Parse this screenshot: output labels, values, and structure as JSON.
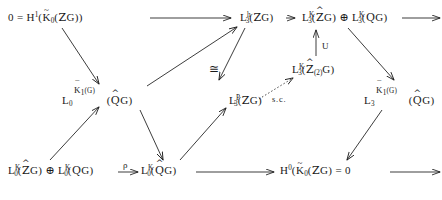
{
  "diagram": {
    "kind": "commutative-diagram",
    "width": 442,
    "height": 200,
    "ink_color": "#1a1a1a",
    "background": "#ffffff",
    "nodes": [
      {
        "id": "n1",
        "name": "node-h1-k0-zg",
        "text": "0 = H^1( K~_0 ( ZZ G))",
        "parts": {
          "zero": "0",
          "equals": "=",
          "H": "H",
          "Hsup": "1",
          "open1": "(",
          "K": "K",
          "Ksub": "0",
          "Kacc": "~",
          "open2": "(",
          "ring": "Z",
          "G": "G",
          "close": "))"
        },
        "x": 8,
        "y": 12
      },
      {
        "id": "n2",
        "name": "node-l3h-zg",
        "text": "L^h_3( ZZ G)",
        "parts": {
          "L": "L",
          "Lsup": "h",
          "Lsub": "3",
          "open": "(",
          "ring": "Z",
          "G": "G",
          "close": ")"
        },
        "x": 240,
        "y": 12
      },
      {
        "id": "n3",
        "name": "node-l3k-zhatg-sum-l3k-qg",
        "text": "L^K_3( ZZ^ G) (+) L^K_3( Q G)",
        "parts": {
          "L1": "L",
          "L1sup": "K",
          "L1sub": "3",
          "open1": "(",
          "ring1": "Z",
          "ring1acc": "^",
          "G1": "G",
          "close1": ")",
          "oplus": "⊕",
          "L2": "L",
          "L2sup": "K",
          "L2sub": "3",
          "open2": "(",
          "ring2": "Q",
          "G2": "G",
          "close2": ")"
        },
        "x": 302,
        "y": 12
      },
      {
        "id": "n4",
        "name": "node-l0-k1bar-qhatg",
        "text": "L^{K~_1(G)}_0( Q^ G)",
        "parts": {
          "L": "L",
          "Lsub": "0",
          "supK": "K",
          "supKacc": "¯",
          "supKsub": "1",
          "supOpen": "(",
          "supG": "G",
          "supClose": ")",
          "open": "(",
          "ring": "Q",
          "ringacc": "^",
          "G": "G",
          "close": ")"
        },
        "x": 62,
        "y": 88
      },
      {
        "id": "n5",
        "name": "node-l3p-zg",
        "text": "L^P_3( ZZ G)",
        "parts": {
          "L": "L",
          "Lsup": "P",
          "Lsub": "3",
          "open": "(",
          "ring": "Z",
          "G": "G",
          "close": ")"
        },
        "x": 229,
        "y": 88
      },
      {
        "id": "n6",
        "name": "node-l3k-zhat2g",
        "text": "L^K_3( ZZ^_(2) G)",
        "parts": {
          "L": "L",
          "Lsup": "K",
          "Lsub": "3",
          "open": "(",
          "ring": "Z",
          "ringacc": "^",
          "ringsub": "(2)",
          "G": "G",
          "close": ")"
        },
        "x": 292,
        "y": 58
      },
      {
        "id": "n7",
        "name": "node-l3-k1bar-qhatg",
        "text": "L^{K~_1(G)}_3( Q^ G)",
        "parts": {
          "L": "L",
          "Lsub": "3",
          "supK": "K",
          "supKacc": "¯",
          "supKsub": "1",
          "supOpen": "(",
          "supG": "G",
          "supClose": ")",
          "open": "(",
          "ring": "Q",
          "ringacc": "^",
          "G": "G",
          "close": ")"
        },
        "x": 364,
        "y": 88
      },
      {
        "id": "n8",
        "name": "node-l0k-zhatg-sum-l0k-qg",
        "text": "L^K_0( ZZ^ G) (+) L^K_0( Q G)",
        "parts": {
          "L1": "L",
          "L1sup": "K",
          "L1sub": "0",
          "open1": "(",
          "ring1": "Z",
          "ring1acc": "^",
          "G1": "G",
          "close1": ")",
          "oplus": "⊕",
          "L2": "L",
          "L2sup": "K",
          "L2sub": "0",
          "open2": "(",
          "ring2": "Q",
          "G2": "G",
          "close2": ")"
        },
        "x": 8,
        "y": 165
      },
      {
        "id": "n9",
        "name": "node-l0k-qhatg",
        "text": "L^K_0( Q^ G)",
        "parts": {
          "L": "L",
          "Lsup": "K",
          "Lsub": "0",
          "open": "(",
          "ring": "Q",
          "ringacc": "^",
          "G": "G",
          "close": ")"
        },
        "x": 141,
        "y": 165
      },
      {
        "id": "n10",
        "name": "node-h0-k0-zg-zero",
        "text": "H^0( K~_0 ( ZZ G) = 0",
        "parts": {
          "H": "H",
          "Hsup": "0",
          "open1": "(",
          "K": "K",
          "Ksub": "0",
          "Kacc": "~",
          "open2": "(",
          "ring": "Z",
          "G": "G",
          "close": ")",
          "equals": "=",
          "zero": "0"
        },
        "x": 280,
        "y": 165
      }
    ],
    "arrow_labels": [
      {
        "id": "lab-union",
        "name": "arrow-label-union",
        "text": "U",
        "x": 322,
        "y": 41
      },
      {
        "id": "lab-sc",
        "name": "arrow-label-sc",
        "text": "s.c.",
        "x": 272,
        "y": 94
      },
      {
        "id": "lab-iso",
        "name": "arrow-label-iso",
        "text": "≅",
        "x": 209,
        "y": 68
      },
      {
        "id": "lab-rho",
        "name": "arrow-label-rho",
        "text": "ρ",
        "x": 123,
        "y": 162
      }
    ],
    "edges": [
      {
        "name": "edge-n1-to-n2",
        "kind": "horizontal",
        "style": "solid"
      },
      {
        "name": "edge-n2-to-n3",
        "kind": "horizontal",
        "style": "solid"
      },
      {
        "name": "edge-n3-to-right",
        "kind": "horizontal",
        "style": "solid"
      },
      {
        "name": "edge-n1-to-n4",
        "kind": "diagonal-down-right",
        "style": "solid"
      },
      {
        "name": "edge-n4-to-n2",
        "kind": "diagonal-up-right",
        "style": "solid"
      },
      {
        "name": "edge-n3-to-n7",
        "kind": "diagonal-down-right",
        "style": "solid"
      },
      {
        "name": "edge-n6-to-n3",
        "kind": "vertical-up",
        "style": "solid"
      },
      {
        "name": "edge-n5-to-n6",
        "kind": "diagonal-up-right-dotted",
        "style": "dotted"
      },
      {
        "name": "edge-n2-to-n5",
        "kind": "diagonal-down-left",
        "style": "solid"
      },
      {
        "name": "edge-n8-to-n4",
        "kind": "diagonal-up-right",
        "style": "solid"
      },
      {
        "name": "edge-n8-to-n9",
        "kind": "horizontal",
        "style": "solid"
      },
      {
        "name": "edge-n4-to-n9",
        "kind": "diagonal-down-right",
        "style": "solid"
      },
      {
        "name": "edge-n9-to-n5",
        "kind": "diagonal-up-right",
        "style": "solid"
      },
      {
        "name": "edge-n9-to-n10",
        "kind": "horizontal",
        "style": "solid"
      },
      {
        "name": "edge-n7-to-n10",
        "kind": "diagonal-down-left",
        "style": "solid"
      },
      {
        "name": "edge-n10-to-right",
        "kind": "horizontal",
        "style": "solid"
      }
    ]
  }
}
